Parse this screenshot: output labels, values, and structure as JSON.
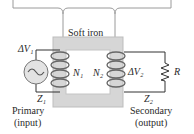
{
  "diagram": {
    "core_label": "Soft iron",
    "primary": {
      "voltage": "ΔV₁",
      "turns": "N₁",
      "impedance": "Z₁",
      "label": "Primary",
      "sublabel": "(input)"
    },
    "secondary": {
      "voltage": "ΔV₂",
      "turns": "N₂",
      "impedance": "Z₂",
      "label": "Secondary",
      "sublabel": "(output)",
      "load": "R"
    },
    "colors": {
      "core": "#d9d9d9",
      "wire": "#333333",
      "coil": "#555555",
      "source_fill": "#e6e6e6"
    }
  }
}
